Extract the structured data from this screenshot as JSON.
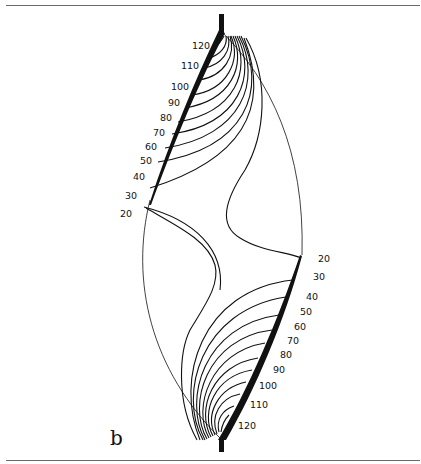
{
  "figure": {
    "panel_label": "b",
    "left_labels": [
      "120",
      "110",
      "100",
      "90",
      "80",
      "70",
      "60",
      "50",
      "40",
      "30",
      "20"
    ],
    "right_labels": [
      "20",
      "30",
      "40",
      "50",
      "60",
      "70",
      "80",
      "90",
      "100",
      "110",
      "120"
    ]
  }
}
